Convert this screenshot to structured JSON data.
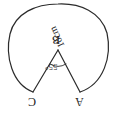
{
  "figure": {
    "name": "circle-segment-triangle-diagram",
    "orientation": "rotated-180",
    "stroke_color": "#2b2b2b",
    "background_color": "#ffffff",
    "vertices": {
      "apex": "B",
      "left_base": "C",
      "right_base": "A"
    },
    "labels": {
      "vertex_b": "B",
      "vertex_c": "C",
      "vertex_a": "A",
      "angle_at_b": "55°",
      "side_ba": "10cm"
    },
    "measurements": {
      "angle_value": 55,
      "angle_unit": "degrees",
      "radius_value": 10,
      "radius_unit": "cm"
    },
    "geometry": {
      "apex_point": [
        58,
        50
      ],
      "left_base_point": [
        33,
        92
      ],
      "right_base_point": [
        80,
        92
      ],
      "arc_leftmost_x": 8,
      "arc_rightmost_x": 109,
      "arc_top_y": 4,
      "angle_marker": "small-arc"
    }
  }
}
